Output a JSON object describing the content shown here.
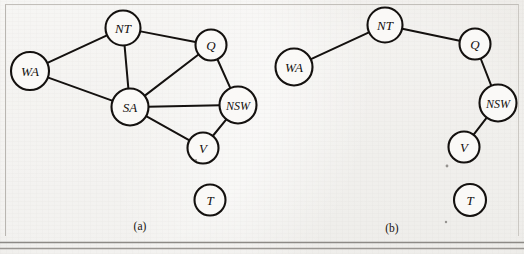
{
  "figure": {
    "background_color": "#e9e7e3",
    "ink_color": "#14110f",
    "node_fill": "#faf9f7",
    "rule_color": "#8d8a86"
  },
  "panels": [
    {
      "id": "a",
      "caption": "(a)",
      "caption_pos": {
        "x": 140,
        "y": 226
      },
      "nodes": [
        {
          "id": "WA",
          "label": "WA",
          "x": 30,
          "y": 71,
          "r": 19,
          "font_size": 13
        },
        {
          "id": "NT",
          "label": "NT",
          "x": 123,
          "y": 28,
          "r": 17.5,
          "font_size": 13
        },
        {
          "id": "Q",
          "label": "Q",
          "x": 211,
          "y": 45,
          "r": 15.5,
          "font_size": 13
        },
        {
          "id": "SA",
          "label": "SA",
          "x": 130,
          "y": 107,
          "r": 18.5,
          "font_size": 13
        },
        {
          "id": "NSW",
          "label": "NSW",
          "x": 238,
          "y": 105,
          "r": 18.5,
          "font_size": 12
        },
        {
          "id": "V",
          "label": "V",
          "x": 203,
          "y": 148,
          "r": 15.5,
          "font_size": 13
        },
        {
          "id": "T",
          "label": "T",
          "x": 210,
          "y": 200,
          "r": 15.5,
          "font_size": 13
        }
      ],
      "edges": [
        {
          "from": "WA",
          "to": "NT"
        },
        {
          "from": "WA",
          "to": "SA"
        },
        {
          "from": "NT",
          "to": "SA"
        },
        {
          "from": "NT",
          "to": "Q"
        },
        {
          "from": "SA",
          "to": "Q"
        },
        {
          "from": "SA",
          "to": "NSW"
        },
        {
          "from": "SA",
          "to": "V"
        },
        {
          "from": "Q",
          "to": "NSW"
        },
        {
          "from": "NSW",
          "to": "V"
        }
      ]
    },
    {
      "id": "b",
      "caption": "(b)",
      "caption_pos": {
        "x": 392,
        "y": 228
      },
      "nodes": [
        {
          "id": "WA",
          "label": "WA",
          "x": 294,
          "y": 67,
          "r": 18.5,
          "font_size": 13
        },
        {
          "id": "NT",
          "label": "NT",
          "x": 385,
          "y": 25,
          "r": 17.5,
          "font_size": 13
        },
        {
          "id": "Q",
          "label": "Q",
          "x": 475,
          "y": 44,
          "r": 15.5,
          "font_size": 13
        },
        {
          "id": "NSW",
          "label": "NSW",
          "x": 498,
          "y": 103,
          "r": 18.5,
          "font_size": 12
        },
        {
          "id": "V",
          "label": "V",
          "x": 464,
          "y": 147,
          "r": 15.5,
          "font_size": 13
        },
        {
          "id": "T",
          "label": "T",
          "x": 470,
          "y": 200,
          "r": 16,
          "font_size": 13
        }
      ],
      "edges": [
        {
          "from": "WA",
          "to": "NT"
        },
        {
          "from": "NT",
          "to": "Q"
        },
        {
          "from": "Q",
          "to": "NSW"
        },
        {
          "from": "NSW",
          "to": "V"
        }
      ]
    }
  ],
  "rules": [
    {
      "name": "rule-upper",
      "x1": 0,
      "y1": 242.5,
      "x2": 524,
      "y2": 242.5,
      "width": 1.6,
      "color": "#8d8a86"
    },
    {
      "name": "rule-lower",
      "x1": 0,
      "y1": 248.5,
      "x2": 524,
      "y2": 248.5,
      "width": 1.4,
      "color": "#9a9793"
    }
  ],
  "specks": [
    {
      "x": 447,
      "y": 166,
      "r": 1.4
    },
    {
      "x": 446,
      "y": 222,
      "r": 1.2
    },
    {
      "x": 196,
      "y": 160,
      "r": 1.0
    }
  ]
}
